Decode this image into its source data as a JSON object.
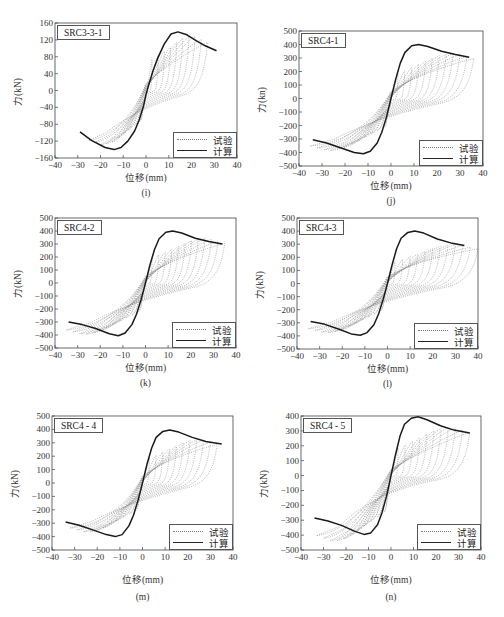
{
  "figure": {
    "legend": {
      "test_label": "试验",
      "calc_label": "计算"
    },
    "x_axis_label": "位移(mm)"
  },
  "chart_data": [
    {
      "id": "i",
      "type": "line",
      "title": "SRC3-3-1",
      "caption": "(i)",
      "xlabel": "位移(mm)",
      "ylabel": "力(kN)",
      "xlim": [
        -40,
        40
      ],
      "ylim": [
        -160,
        160
      ],
      "xticks": [
        -40,
        -30,
        -20,
        -10,
        0,
        10,
        20,
        30,
        40
      ],
      "yticks": [
        -160,
        -120,
        -80,
        -40,
        0,
        40,
        80,
        120,
        160
      ],
      "legend_position": "lower right",
      "grid": false,
      "series": [
        {
          "name": "计算",
          "style": "solid",
          "x": [
            -29,
            -24,
            -18,
            -14,
            -11,
            -8,
            -5,
            -3,
            -1,
            0,
            1,
            3,
            5,
            8,
            11,
            14,
            18,
            22,
            26,
            31
          ],
          "y": [
            -98,
            -118,
            -135,
            -140,
            -135,
            -120,
            -96,
            -70,
            -35,
            -10,
            10,
            45,
            75,
            110,
            134,
            139,
            132,
            118,
            106,
            94
          ]
        },
        {
          "name": "试验",
          "style": "dotted",
          "peak_pos": 142,
          "peak_neg": -140,
          "max_disp_pos": 27,
          "max_disp_neg": -25,
          "cycles": 10
        }
      ],
      "pos": {
        "left": 55,
        "top": 23,
        "right": 237,
        "bottom": 158
      }
    },
    {
      "id": "j",
      "type": "line",
      "title": "SRC4-1",
      "caption": "(j)",
      "xlabel": "位移(mm)",
      "ylabel": "力(kn)",
      "xlim": [
        -40,
        40
      ],
      "ylim": [
        -500,
        500
      ],
      "xticks": [
        -40,
        -30,
        -20,
        -10,
        0,
        10,
        20,
        30,
        40
      ],
      "yticks": [
        -500,
        -400,
        -300,
        -200,
        -100,
        0,
        100,
        200,
        300,
        400,
        500
      ],
      "legend_position": "lower right",
      "grid": false,
      "series": [
        {
          "name": "计算",
          "style": "solid",
          "x": [
            -34,
            -28,
            -22,
            -16,
            -12,
            -9,
            -6,
            -4,
            -2,
            0,
            2,
            4,
            6,
            9,
            12,
            16,
            22,
            28,
            34
          ],
          "y": [
            -305,
            -330,
            -365,
            -400,
            -410,
            -390,
            -330,
            -250,
            -140,
            0,
            140,
            260,
            340,
            390,
            400,
            385,
            350,
            325,
            305
          ]
        },
        {
          "name": "试验",
          "style": "dotted",
          "peak_pos": 370,
          "peak_neg": -420,
          "max_disp_pos": 36,
          "max_disp_neg": -35,
          "cycles": 12
        }
      ],
      "pos": {
        "left": 299,
        "top": 31,
        "right": 483,
        "bottom": 166
      }
    },
    {
      "id": "k",
      "type": "line",
      "title": "SRC4-2",
      "caption": "(k)",
      "xlabel": "位移(mm)",
      "ylabel": "力(kN)",
      "xlim": [
        -40,
        40
      ],
      "ylim": [
        -500,
        500
      ],
      "xticks": [
        -40,
        -30,
        -20,
        -10,
        0,
        10,
        20,
        30,
        40
      ],
      "yticks": [
        -500,
        -400,
        -300,
        -200,
        -100,
        0,
        100,
        200,
        300,
        400,
        500
      ],
      "legend_position": "lower right",
      "grid": false,
      "series": [
        {
          "name": "计算",
          "style": "solid",
          "x": [
            -34,
            -28,
            -22,
            -16,
            -12,
            -9,
            -6,
            -4,
            -2,
            0,
            2,
            4,
            6,
            9,
            12,
            16,
            22,
            28,
            34
          ],
          "y": [
            -300,
            -320,
            -350,
            -390,
            -405,
            -385,
            -320,
            -240,
            -130,
            0,
            140,
            260,
            340,
            390,
            400,
            385,
            345,
            320,
            300
          ]
        },
        {
          "name": "试验",
          "style": "dotted",
          "peak_pos": 380,
          "peak_neg": -430,
          "max_disp_pos": 35,
          "max_disp_neg": -35,
          "cycles": 12
        }
      ],
      "pos": {
        "left": 55,
        "top": 218,
        "right": 236,
        "bottom": 348
      }
    },
    {
      "id": "l",
      "type": "line",
      "title": "SRC4-3",
      "caption": "(l)",
      "xlabel": "位移(mm)",
      "ylabel": "力(kN)",
      "xlim": [
        -40,
        40
      ],
      "ylim": [
        -500,
        500
      ],
      "xticks": [
        -40,
        -30,
        -20,
        -10,
        0,
        10,
        20,
        30,
        40
      ],
      "yticks": [
        -500,
        -400,
        -300,
        -200,
        -100,
        0,
        100,
        200,
        300,
        400,
        500
      ],
      "legend_position": "lower right",
      "grid": false,
      "series": [
        {
          "name": "计算",
          "style": "solid",
          "x": [
            -34,
            -28,
            -22,
            -16,
            -12,
            -9,
            -6,
            -4,
            -2,
            0,
            2,
            4,
            6,
            9,
            12,
            16,
            22,
            28,
            34
          ],
          "y": [
            -290,
            -310,
            -345,
            -385,
            -395,
            -375,
            -315,
            -235,
            -125,
            0,
            140,
            265,
            345,
            390,
            400,
            385,
            340,
            310,
            290
          ]
        },
        {
          "name": "试验",
          "style": "dotted",
          "peak_pos": 330,
          "peak_neg": -410,
          "max_disp_pos": 40,
          "max_disp_neg": -35,
          "cycles": 12
        }
      ],
      "pos": {
        "left": 297,
        "top": 218,
        "right": 478,
        "bottom": 349
      }
    },
    {
      "id": "m",
      "type": "line",
      "title": "SRC4 - 4",
      "caption": "(m)",
      "xlabel": "位移(mm)",
      "ylabel": "力(kN)",
      "xlim": [
        -40,
        40
      ],
      "ylim": [
        -500,
        500
      ],
      "xticks": [
        -40,
        -30,
        -20,
        -10,
        0,
        10,
        20,
        30,
        40
      ],
      "yticks": [
        -500,
        -400,
        -300,
        -200,
        -100,
        0,
        100,
        200,
        300,
        400,
        500
      ],
      "legend_position": "lower right",
      "grid": false,
      "series": [
        {
          "name": "计算",
          "style": "solid",
          "x": [
            -34,
            -28,
            -22,
            -16,
            -12,
            -9,
            -6,
            -4,
            -2,
            0,
            2,
            4,
            6,
            9,
            12,
            16,
            22,
            28,
            35
          ],
          "y": [
            -290,
            -315,
            -350,
            -385,
            -400,
            -385,
            -320,
            -240,
            -130,
            0,
            140,
            260,
            340,
            385,
            395,
            380,
            340,
            310,
            290
          ]
        },
        {
          "name": "试验",
          "style": "dotted",
          "peak_pos": 360,
          "peak_neg": -400,
          "max_disp_pos": 33,
          "max_disp_neg": -32,
          "cycles": 11
        }
      ],
      "pos": {
        "left": 52,
        "top": 416,
        "right": 233,
        "bottom": 550
      }
    },
    {
      "id": "n",
      "type": "line",
      "title": "SRC4 - 5",
      "caption": "(n)",
      "xlabel": "位移(mm)",
      "ylabel": "力(kN)",
      "xlim": [
        -40,
        40
      ],
      "ylim": [
        -500,
        400
      ],
      "xticks": [
        -40,
        -30,
        -20,
        -10,
        0,
        10,
        20,
        30,
        40
      ],
      "yticks": [
        -500,
        -400,
        -300,
        -200,
        -100,
        0,
        100,
        200,
        300,
        400
      ],
      "legend_position": "lower right",
      "grid": false,
      "series": [
        {
          "name": "计算",
          "style": "solid",
          "x": [
            -34,
            -28,
            -22,
            -16,
            -12,
            -9,
            -6,
            -4,
            -2,
            0,
            2,
            4,
            6,
            9,
            12,
            16,
            22,
            28,
            35
          ],
          "y": [
            -285,
            -305,
            -335,
            -375,
            -395,
            -385,
            -330,
            -250,
            -140,
            0,
            140,
            265,
            345,
            385,
            395,
            375,
            335,
            305,
            285
          ]
        },
        {
          "name": "试验",
          "style": "dotted",
          "peak_pos": 360,
          "peak_neg": -480,
          "max_disp_pos": 35,
          "max_disp_neg": -33,
          "cycles": 11
        }
      ],
      "pos": {
        "left": 301,
        "top": 416,
        "right": 481,
        "bottom": 550
      }
    }
  ]
}
